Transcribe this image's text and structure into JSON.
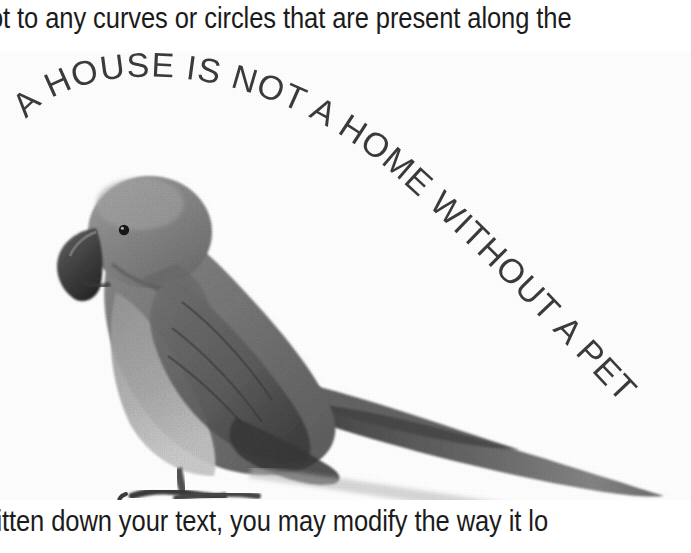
{
  "page": {
    "background_color": "#ffffff",
    "width": 691,
    "height": 553
  },
  "document": {
    "top_text_line": "ot to any curves or circles that are present along the",
    "bottom_text_line": "ritten down your text, you may modify the way it lo",
    "text_color": "#1b1b1b"
  },
  "artwork": {
    "name": "parrot-with-curved-slogan",
    "subject": "grayscale photograph of a ring-necked parakeet standing in profile, facing left, with a long tapering tail extending to the right",
    "curved_text": "A HOUSE IS NOT A HOME WITHOUT A PET",
    "curved_text_words": [
      "A",
      "HOUSE",
      "IS",
      "NOT",
      "A",
      "HOME",
      "WITHOUT",
      "A",
      "PET"
    ],
    "curved_text_color": "#3b3b3b",
    "curve_description": "text follows a large clockwise arc from the upper-left, over the bird's head, down its back and along the tail toward the lower right",
    "bird_tones": {
      "body_gray": "#7d7d7d",
      "wing_gray": "#6a6a6a",
      "shadow_gray": "#4a4a4a",
      "dark_accent": "#333333",
      "highlight_gray": "#b9b9b9",
      "breast_light": "#a2a2a2",
      "beak_dark": "#3a3a3a",
      "eye_color": "#1a1a1a"
    }
  }
}
